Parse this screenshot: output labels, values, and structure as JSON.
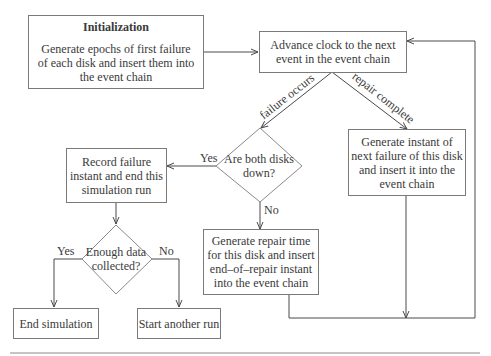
{
  "diagram": {
    "type": "flowchart",
    "nodes": {
      "init": {
        "title": "Initialization",
        "lines": [
          "Generate epochs of first failure",
          "of each disk and insert them into",
          "the event chain"
        ]
      },
      "advance": {
        "lines": [
          "Advance clock to the next",
          "event in the event chain"
        ]
      },
      "both_down": {
        "lines": [
          "Are both disks",
          "down?"
        ]
      },
      "record": {
        "lines": [
          "Record failure",
          "instant and end this",
          "simulation run"
        ]
      },
      "enough": {
        "lines": [
          "Enough data",
          "collected?"
        ]
      },
      "end_sim": {
        "label": "End simulation"
      },
      "start_run": {
        "label": "Start another run"
      },
      "gen_repair": {
        "lines": [
          "Generate repair time",
          "for this disk and insert",
          "end–of–repair instant",
          "into the event chain"
        ]
      },
      "gen_failure": {
        "lines": [
          "Generate instant of",
          "next failure of this disk",
          "and insert it into the",
          "event chain"
        ]
      }
    },
    "edge_labels": {
      "failure_occurs": "failure occurs",
      "repair_complete": "repair complete",
      "both_yes": "Yes",
      "both_no": "No",
      "enough_yes": "Yes",
      "enough_no": "No"
    },
    "colors": {
      "line": "#4a4a4a",
      "border": "#7a7a7a",
      "text": "#3a3a3a"
    }
  }
}
